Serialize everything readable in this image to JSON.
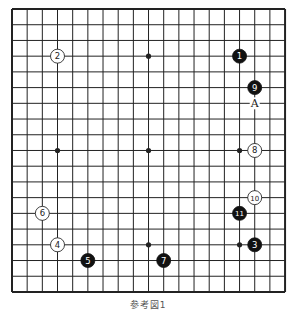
{
  "diagram": {
    "type": "go-board",
    "size": 19,
    "origin": {
      "x": 12,
      "y": 9
    },
    "spacing": {
      "x": 15.17,
      "y": 15.72
    },
    "colors": {
      "line": "#222222",
      "black_stone": "#111111",
      "white_stone": "#ffffff",
      "background": "#ffffff"
    },
    "star_points": [
      [
        3,
        3
      ],
      [
        9,
        3
      ],
      [
        15,
        3
      ],
      [
        3,
        9
      ],
      [
        9,
        9
      ],
      [
        15,
        9
      ],
      [
        3,
        15
      ],
      [
        9,
        15
      ],
      [
        15,
        15
      ]
    ],
    "stones": [
      {
        "move": "1",
        "color": "black",
        "col": 15,
        "row": 3
      },
      {
        "move": "2",
        "color": "white",
        "col": 3,
        "row": 3
      },
      {
        "move": "3",
        "color": "black",
        "col": 16,
        "row": 15
      },
      {
        "move": "4",
        "color": "white",
        "col": 3,
        "row": 15
      },
      {
        "move": "5",
        "color": "black",
        "col": 5,
        "row": 16
      },
      {
        "move": "6",
        "color": "white",
        "col": 2,
        "row": 13
      },
      {
        "move": "7",
        "color": "black",
        "col": 10,
        "row": 16
      },
      {
        "move": "8",
        "color": "white",
        "col": 16,
        "row": 9
      },
      {
        "move": "9",
        "color": "black",
        "col": 16,
        "row": 5
      },
      {
        "move": "10",
        "color": "white",
        "col": 16,
        "row": 12
      },
      {
        "move": "11",
        "color": "black",
        "col": 15,
        "row": 13
      }
    ],
    "labels": [
      {
        "text": "A",
        "col": 16,
        "row": 6
      }
    ]
  },
  "caption": "参考図1"
}
